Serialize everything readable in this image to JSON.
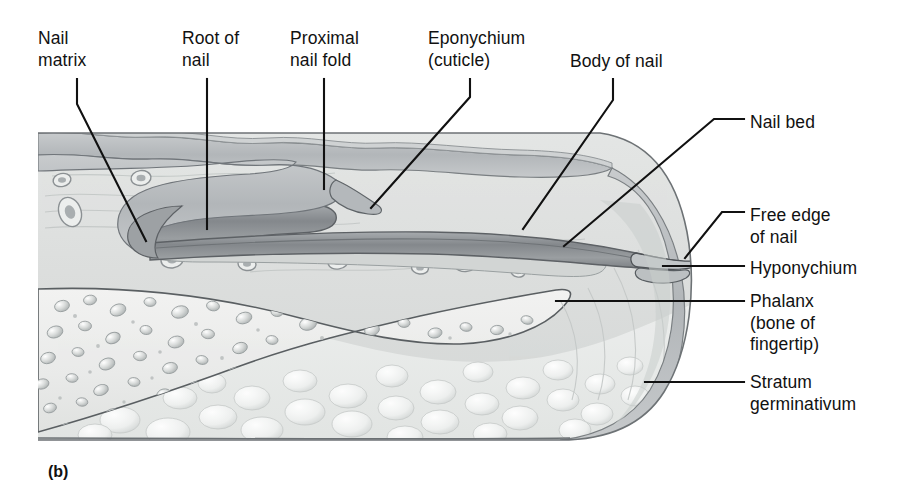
{
  "figure": {
    "caption": "(b)",
    "colors": {
      "line": "#111111",
      "nail_plate": "#8e9296",
      "nail_plate_dark": "#6d7276",
      "epidermis": "#b9bcbe",
      "dermis": "#dcdedd",
      "bone": "#ededec",
      "fat": "#e6e8e7",
      "outline": "#4b5053",
      "background": "#ffffff"
    }
  },
  "labels": [
    {
      "id": "nail-matrix",
      "lines": [
        "Nail",
        "matrix"
      ],
      "x": 38,
      "y": 28,
      "align": "left"
    },
    {
      "id": "root-of-nail",
      "lines": [
        "Root of",
        "nail"
      ],
      "x": 182,
      "y": 28,
      "align": "left"
    },
    {
      "id": "proximal-nail-fold",
      "lines": [
        "Proximal",
        "nail fold"
      ],
      "x": 290,
      "y": 28,
      "align": "left"
    },
    {
      "id": "eponychium-cuticle",
      "lines": [
        "Eponychium",
        "(cuticle)"
      ],
      "x": 428,
      "y": 28,
      "align": "left"
    },
    {
      "id": "body-of-nail",
      "lines": [
        "Body of nail"
      ],
      "x": 570,
      "y": 51,
      "align": "left"
    },
    {
      "id": "nail-bed",
      "lines": [
        "Nail bed"
      ],
      "x": 750,
      "y": 112,
      "align": "left"
    },
    {
      "id": "free-edge-of-nail",
      "lines": [
        "Free edge",
        "of nail"
      ],
      "x": 750,
      "y": 205,
      "align": "left"
    },
    {
      "id": "hyponychium",
      "lines": [
        "Hyponychium"
      ],
      "x": 750,
      "y": 258,
      "align": "left"
    },
    {
      "id": "phalanx",
      "lines": [
        "Phalanx",
        "(bone of",
        "fingertip)"
      ],
      "x": 750,
      "y": 291,
      "align": "left"
    },
    {
      "id": "stratum-germinativum",
      "lines": [
        "Stratum",
        "germinativum"
      ],
      "x": 750,
      "y": 372,
      "align": "left"
    }
  ],
  "leader_lines": [
    {
      "id": "nail-matrix-leader",
      "points": "77,79 77,104 146,241"
    },
    {
      "id": "root-of-nail-leader",
      "points": "207,79 207,229"
    },
    {
      "id": "proximal-nail-fold-leader",
      "points": "324,79 324,189"
    },
    {
      "id": "eponychium-leader",
      "points": "470,79 470,97 371,208"
    },
    {
      "id": "body-of-nail-leader",
      "points": "613,79 613,100 523,229"
    },
    {
      "id": "nail-bed-leader",
      "points": "744,119 714,119 564,246"
    },
    {
      "id": "free-edge-leader",
      "points": "744,212 722,212 685,258"
    },
    {
      "id": "hyponychium-leader",
      "points": "744,266 663,266"
    },
    {
      "id": "phalanx-leader",
      "points": "744,301 556,301"
    },
    {
      "id": "stratum-germinativum-leader",
      "points": "744,382 645,382"
    }
  ]
}
